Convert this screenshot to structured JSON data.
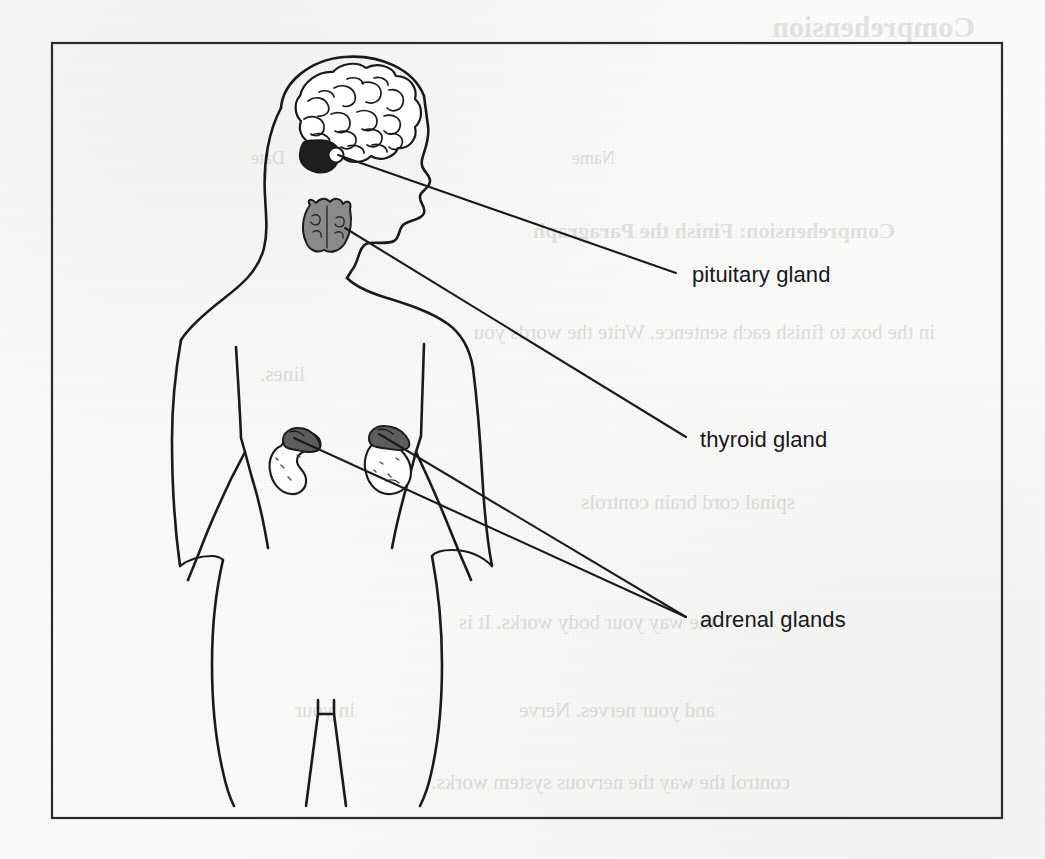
{
  "page": {
    "kind": "scanned-worksheet-page",
    "background_color": "#fdfdfc",
    "ink_color": "#1a1a1a",
    "frame": {
      "name": "diagram-border",
      "x": 52,
      "y": 43,
      "width": 950,
      "height": 775,
      "stroke_color": "#2b2b2b",
      "stroke_width": 2.2
    }
  },
  "diagram": {
    "figure_name": "human-body-outline",
    "fill_light": "#ffffff",
    "gland_fill_mid": "#8a8a8a",
    "gland_fill_dark": "#1e1e1e",
    "labels": [
      {
        "id": "pituitary",
        "text": "pituitary gland",
        "x": 692,
        "y": 262,
        "leader": {
          "from_x": 338,
          "from_y": 155,
          "to_x": 676,
          "to_y": 273
        },
        "organ_name": "pituitary-gland"
      },
      {
        "id": "thyroid",
        "text": "thyroid gland",
        "x": 700,
        "y": 427,
        "leader": {
          "from_x": 345,
          "from_y": 228,
          "to_x": 686,
          "to_y": 437
        },
        "organ_name": "thyroid-gland"
      },
      {
        "id": "adrenal",
        "text": "adrenal glands",
        "x": 700,
        "y": 607,
        "leaders": [
          {
            "from_x": 294,
            "from_y": 438,
            "to_x": 686,
            "to_y": 617
          },
          {
            "from_x": 379,
            "from_y": 434,
            "to_x": 686,
            "to_y": 617
          }
        ],
        "organ_name": "adrenal-glands"
      }
    ],
    "organs": [
      {
        "name": "brain",
        "note": "convoluted cerebrum in head profile"
      },
      {
        "name": "cerebellum",
        "note": "dark filled mass below cerebrum"
      },
      {
        "name": "pituitary-gland",
        "note": "small circle at base of brain"
      },
      {
        "name": "thyroid-gland",
        "note": "butterfly shape at base of neck"
      },
      {
        "name": "left-kidney",
        "note": "bean shape, light fill"
      },
      {
        "name": "right-kidney",
        "note": "bean shape, light fill"
      },
      {
        "name": "left-adrenal-gland",
        "note": "dark cap atop left kidney"
      },
      {
        "name": "right-adrenal-gland",
        "note": "dark cap atop right kidney"
      }
    ]
  },
  "bleed_text": {
    "note": "faint show-through text from the reverse side of the worksheet",
    "lines": [
      {
        "text": "Comprehension",
        "x": 70,
        "y": 10,
        "size": 30,
        "heavy": true
      },
      {
        "text": "Comprehension:  Finish the Paragraph",
        "x": 150,
        "y": 218,
        "size": 22,
        "heavy": true
      },
      {
        "text": "in the box to finish each sentence.  Write the words you",
        "x": 110,
        "y": 320,
        "size": 21,
        "heavy": false
      },
      {
        "text": "lines.",
        "x": 740,
        "y": 362,
        "size": 21,
        "heavy": false
      },
      {
        "text": "spinal cord          brain          controls",
        "x": 250,
        "y": 490,
        "size": 21,
        "heavy": false
      },
      {
        "text": "the way your body works.  It is",
        "x": 330,
        "y": 610,
        "size": 21,
        "heavy": false
      },
      {
        "text": "in your",
        "x": 690,
        "y": 698,
        "size": 21,
        "heavy": false
      },
      {
        "text": "and your nerves.  Nerve",
        "x": 330,
        "y": 698,
        "size": 21,
        "heavy": false
      },
      {
        "text": "control the way the nervous system works.",
        "x": 255,
        "y": 770,
        "size": 21,
        "heavy": false
      },
      {
        "text": "Name",
        "x": 430,
        "y": 148,
        "size": 18,
        "heavy": false
      },
      {
        "text": "Date",
        "x": 760,
        "y": 148,
        "size": 18,
        "heavy": false
      }
    ]
  }
}
